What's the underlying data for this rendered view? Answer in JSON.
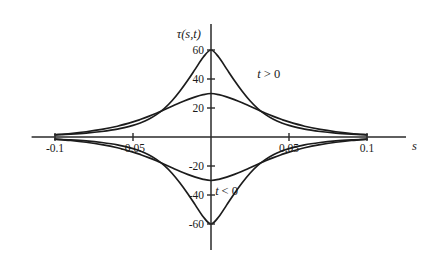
{
  "chart_data": {
    "type": "line",
    "title": "",
    "subtitle": "",
    "xlabel": "s",
    "ylabel": "τ(s,t)",
    "xlim": [
      -0.115,
      0.125
    ],
    "ylim": [
      -78,
      78
    ],
    "grid": false,
    "legend": "none",
    "x_ticks": [
      {
        "value": -0.1,
        "label": "-0.1"
      },
      {
        "value": -0.05,
        "label": "-0.05"
      },
      {
        "value": 0.05,
        "label": "0.05"
      },
      {
        "value": 0.1,
        "label": "0.1"
      }
    ],
    "y_ticks": [
      {
        "value": 60,
        "label": "60"
      },
      {
        "value": 40,
        "label": "40"
      },
      {
        "value": 20,
        "label": "20"
      },
      {
        "value": -20,
        "label": "-20"
      },
      {
        "value": -40,
        "label": "-40"
      },
      {
        "value": -60,
        "label": "-60"
      }
    ],
    "annotations": [
      {
        "text": "t > 0",
        "x": 0.037,
        "y": 41,
        "name": "t-positive-label"
      },
      {
        "text": "t < 0",
        "x": 0.01,
        "y": -40,
        "name": "t-negative-label"
      }
    ],
    "series": [
      {
        "name": "tau positive sharp",
        "peak": 60,
        "sign": "positive",
        "x": [
          -0.1,
          -0.09,
          -0.08,
          -0.07,
          -0.06,
          -0.05,
          -0.045,
          -0.04,
          -0.035,
          -0.03,
          -0.025,
          -0.02,
          -0.015,
          -0.01,
          -0.005,
          0,
          0.005,
          0.01,
          0.015,
          0.02,
          0.025,
          0.03,
          0.035,
          0.04,
          0.045,
          0.05,
          0.06,
          0.07,
          0.08,
          0.09,
          0.1
        ],
        "values": [
          1.5,
          2.0,
          2.7,
          3.8,
          5.4,
          8.0,
          9.8,
          12.2,
          15.4,
          19.6,
          25.0,
          31.6,
          39.0,
          47.0,
          55.0,
          60.0,
          55.0,
          47.0,
          39.0,
          31.6,
          25.0,
          19.6,
          15.4,
          12.2,
          9.8,
          8.0,
          5.4,
          3.8,
          2.7,
          2.0,
          1.5
        ]
      },
      {
        "name": "tau positive broad",
        "peak": 30,
        "sign": "positive",
        "x": [
          -0.1,
          -0.09,
          -0.08,
          -0.07,
          -0.06,
          -0.05,
          -0.045,
          -0.04,
          -0.035,
          -0.03,
          -0.025,
          -0.02,
          -0.015,
          -0.01,
          -0.005,
          0,
          0.005,
          0.01,
          0.015,
          0.02,
          0.025,
          0.03,
          0.035,
          0.04,
          0.045,
          0.05,
          0.06,
          0.07,
          0.08,
          0.09,
          0.1
        ],
        "values": [
          1.5,
          2.4,
          3.6,
          5.2,
          7.4,
          10.4,
          12.2,
          14.2,
          16.4,
          18.8,
          21.2,
          23.6,
          25.8,
          27.7,
          29.2,
          30.0,
          29.2,
          27.7,
          25.8,
          23.6,
          21.2,
          18.8,
          16.4,
          14.2,
          12.2,
          10.4,
          7.4,
          5.2,
          3.6,
          2.4,
          1.5
        ]
      },
      {
        "name": "tau negative sharp",
        "peak": -60,
        "sign": "negative",
        "x": [
          -0.1,
          -0.09,
          -0.08,
          -0.07,
          -0.06,
          -0.05,
          -0.045,
          -0.04,
          -0.035,
          -0.03,
          -0.025,
          -0.02,
          -0.015,
          -0.01,
          -0.005,
          0,
          0.005,
          0.01,
          0.015,
          0.02,
          0.025,
          0.03,
          0.035,
          0.04,
          0.045,
          0.05,
          0.06,
          0.07,
          0.08,
          0.09,
          0.1
        ],
        "values": [
          -1.5,
          -2.0,
          -2.7,
          -3.8,
          -5.4,
          -8.0,
          -9.8,
          -12.2,
          -15.4,
          -19.6,
          -25.0,
          -31.6,
          -39.0,
          -47.0,
          -55.0,
          -60.0,
          -55.0,
          -47.0,
          -39.0,
          -31.6,
          -25.0,
          -19.6,
          -15.4,
          -12.2,
          -9.8,
          -8.0,
          -5.4,
          -3.8,
          -2.7,
          -2.0,
          -1.5
        ]
      },
      {
        "name": "tau negative broad",
        "peak": -30,
        "sign": "negative",
        "x": [
          -0.1,
          -0.09,
          -0.08,
          -0.07,
          -0.06,
          -0.05,
          -0.045,
          -0.04,
          -0.035,
          -0.03,
          -0.025,
          -0.02,
          -0.015,
          -0.01,
          -0.005,
          0,
          0.005,
          0.01,
          0.015,
          0.02,
          0.025,
          0.03,
          0.035,
          0.04,
          0.045,
          0.05,
          0.06,
          0.07,
          0.08,
          0.09,
          0.1
        ],
        "values": [
          -1.5,
          -2.4,
          -3.6,
          -5.2,
          -7.4,
          -10.4,
          -12.2,
          -14.2,
          -16.4,
          -18.8,
          -21.2,
          -23.6,
          -25.8,
          -27.7,
          -29.2,
          -30.0,
          -29.2,
          -27.7,
          -25.8,
          -23.6,
          -21.2,
          -18.8,
          -16.4,
          -14.2,
          -12.2,
          -10.4,
          -7.4,
          -5.2,
          -3.6,
          -2.4,
          -1.5
        ]
      }
    ],
    "colors": {
      "curve": "#1c1c1c",
      "axis": "#2a2a2a",
      "text": "#1a1a1a",
      "background": "#ffffff"
    }
  }
}
